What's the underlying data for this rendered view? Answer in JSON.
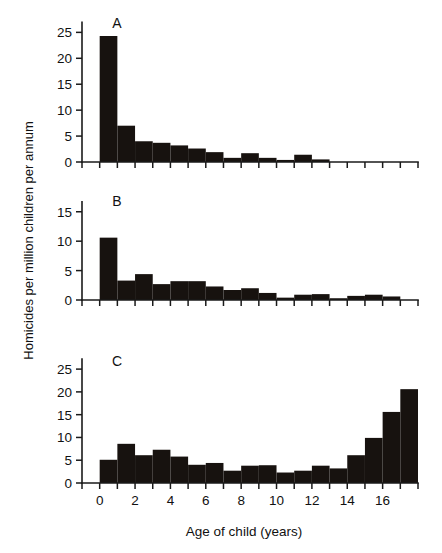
{
  "figure": {
    "ylabel": "Homicides per million children per annum",
    "xlabel": "Age of child (years)",
    "panel_letters": {
      "a": "A",
      "b": "B",
      "c": "C"
    }
  },
  "chart_data": {
    "type": "bar",
    "title": "",
    "xlabel": "Age of child (years)",
    "ylabel": "Homicides per million children per annum",
    "xlim": [
      -1,
      18
    ],
    "x_ticks": [
      -1,
      0,
      1,
      2,
      3,
      4,
      5,
      6,
      7,
      8,
      9,
      10,
      11,
      12,
      13,
      14,
      15,
      16,
      17,
      18
    ],
    "x_tick_labels": [
      "",
      "0",
      "",
      "2",
      "",
      "4",
      "",
      "6",
      "",
      "8",
      "",
      "10",
      "",
      "12",
      "",
      "14",
      "",
      "16",
      "",
      ""
    ],
    "grid": false,
    "legend": "none",
    "note": "Three stacked histogram panels A, B, C sharing the same age-of-child x axis; bars span one year each, left edge at the labelled age.",
    "panels": [
      {
        "id": "A",
        "label": "A",
        "ylim": [
          0,
          27
        ],
        "y_ticks": [
          0,
          5,
          10,
          15,
          20,
          25
        ],
        "y_tick_labels": [
          "0",
          "5",
          "10",
          "15",
          "20",
          "25"
        ],
        "categories": [
          0,
          1,
          2,
          3,
          4,
          5,
          6,
          7,
          8,
          9,
          10,
          11,
          12,
          13,
          14,
          15,
          16,
          17
        ],
        "values": [
          24.3,
          7.0,
          4.0,
          3.7,
          3.2,
          2.6,
          1.9,
          0.8,
          1.7,
          0.8,
          0.4,
          1.4,
          0.5,
          0.0,
          0.0,
          0.0,
          0.0,
          0.0
        ]
      },
      {
        "id": "B",
        "label": "B",
        "ylim": [
          0,
          17
        ],
        "y_ticks": [
          0,
          5,
          10,
          15
        ],
        "y_tick_labels": [
          "0",
          "5",
          "10",
          "15"
        ],
        "categories": [
          0,
          1,
          2,
          3,
          4,
          5,
          6,
          7,
          8,
          9,
          10,
          11,
          12,
          13,
          14,
          15,
          16,
          17
        ],
        "values": [
          10.6,
          3.3,
          4.4,
          2.7,
          3.2,
          3.2,
          2.3,
          1.7,
          2.0,
          1.2,
          0.4,
          0.9,
          1.0,
          0.3,
          0.7,
          0.9,
          0.6,
          0.0
        ]
      },
      {
        "id": "C",
        "label": "C",
        "ylim": [
          0,
          27
        ],
        "y_ticks": [
          0,
          5,
          10,
          15,
          20,
          25
        ],
        "y_tick_labels": [
          "0",
          "5",
          "10",
          "15",
          "20",
          "25"
        ],
        "categories": [
          0,
          1,
          2,
          3,
          4,
          5,
          6,
          7,
          8,
          9,
          10,
          11,
          12,
          13,
          14,
          15,
          16,
          17
        ],
        "values": [
          5.1,
          8.6,
          6.1,
          7.3,
          5.8,
          4.0,
          4.4,
          2.7,
          3.8,
          3.9,
          2.3,
          2.7,
          3.8,
          3.2,
          6.1,
          9.9,
          15.6,
          20.6
        ]
      }
    ]
  },
  "colors": {
    "bar": "#17120f",
    "axis": "#1a1a1a",
    "background": "#ffffff"
  }
}
